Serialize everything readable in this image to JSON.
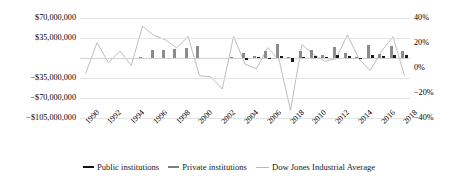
{
  "chart_data": {
    "type": "bar",
    "title": "",
    "xlabel": "",
    "ylabel": "",
    "y2label": "",
    "grid": true,
    "legend_position": "bottom",
    "ylim": [
      -105000000,
      70000000
    ],
    "y2lim": [
      -40,
      40
    ],
    "yticks": [
      "$70,000,000",
      "$35,000,000",
      "",
      "−$35,000,000",
      "−$70,000,000",
      "−$105,000,000"
    ],
    "ytick_values": [
      70000000,
      35000000,
      0,
      -35000000,
      -70000000,
      -105000000
    ],
    "y2ticks": [
      "40%",
      "20%",
      "0%",
      "−20%",
      "−40%"
    ],
    "y2tick_values": [
      40,
      20,
      0,
      -20,
      -40
    ],
    "categories": [
      1990,
      1991,
      1992,
      1993,
      1994,
      1995,
      1996,
      1997,
      1998,
      1999,
      2000,
      2001,
      2002,
      2003,
      2004,
      2005,
      2006,
      2007,
      2008,
      2009,
      2010,
      2011,
      2012,
      2013,
      2014,
      2015,
      2016,
      2017,
      2018
    ],
    "xtick_labels": [
      "1990",
      "1992",
      "1994",
      "1996",
      "1998",
      "2000",
      "2002",
      "2004",
      "2006",
      "2018",
      "2010",
      "2012",
      "2014",
      "2016",
      "2018"
    ],
    "xtick_years": [
      1990,
      1992,
      1994,
      1996,
      1998,
      2000,
      2002,
      2004,
      2006,
      2008,
      2010,
      2012,
      2014,
      2016,
      2018
    ],
    "series": [
      {
        "name": "Public institutions",
        "key": "public",
        "color": "#1b1b1b",
        "axis": "left",
        "type": "bar",
        "values": [
          0,
          0,
          0,
          0,
          0,
          0,
          0,
          0,
          0,
          0,
          0,
          0,
          0,
          0,
          -3500000,
          1800000,
          -1500000,
          4200000,
          -7500000,
          2200000,
          3500000,
          2400000,
          5200000,
          3000000,
          -1200000,
          4800000,
          3100000,
          6200000,
          4500000
        ]
      },
      {
        "name": "Private institutions",
        "key": "private",
        "color": "#8c8c8c",
        "axis": "left",
        "type": "bar",
        "values": [
          0,
          0,
          0,
          0,
          0,
          1500000,
          14000000,
          13500000,
          15500000,
          17500000,
          21000000,
          0,
          0,
          2500000,
          9000000,
          3000000,
          13000000,
          24500000,
          1500000,
          11500000,
          14000000,
          5500000,
          19500000,
          8500000,
          2000000,
          23500000,
          7500000,
          20500000,
          12500000
        ]
      },
      {
        "name": "Dow Jones Industrial Average",
        "key": "djia",
        "color": "#b9b9b9",
        "axis": "right",
        "type": "line",
        "values": [
          -4.3,
          20.3,
          4.2,
          13.7,
          2.1,
          33.5,
          26.0,
          22.6,
          16.1,
          25.2,
          -6.2,
          -7.1,
          -16.8,
          25.3,
          3.1,
          -0.6,
          16.3,
          6.4,
          -33.8,
          18.8,
          11.0,
          5.5,
          7.3,
          26.5,
          7.5,
          -2.2,
          13.4,
          25.1,
          -5.6
        ]
      }
    ]
  },
  "legend": {
    "items": [
      {
        "label": "Public institutions",
        "icon": "thick-line-swatch"
      },
      {
        "label": "Private institutions",
        "icon": "medium-line-swatch"
      },
      {
        "label": "Dow Jones Industrial Average",
        "icon": "thin-line-swatch"
      }
    ]
  }
}
